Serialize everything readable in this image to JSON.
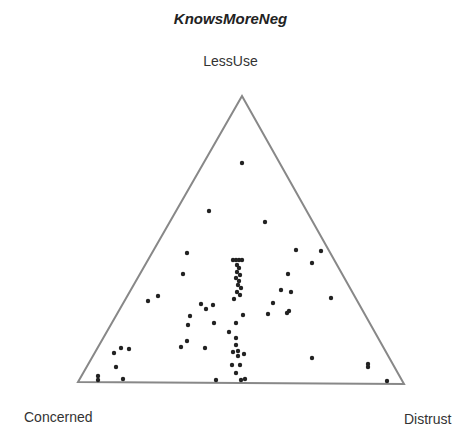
{
  "chart_data": {
    "type": "scatter",
    "subtype": "ternary",
    "title": "KnowsMoreNeg",
    "vertex_labels": {
      "top": "LessUse",
      "left": "Concerned",
      "right": "Distrust"
    },
    "triangle": {
      "top": [
        242,
        96
      ],
      "left": [
        78,
        382
      ],
      "right": [
        404,
        384
      ]
    },
    "grid": false,
    "legend": null,
    "point_color": "#222222",
    "line_color": "#888888",
    "points_px": [
      [
        242,
        163
      ],
      [
        209,
        211
      ],
      [
        265,
        222
      ],
      [
        187,
        253
      ],
      [
        183,
        274
      ],
      [
        288,
        274
      ],
      [
        233,
        260
      ],
      [
        236,
        260
      ],
      [
        239,
        260
      ],
      [
        242,
        260
      ],
      [
        237,
        265
      ],
      [
        239,
        268
      ],
      [
        237,
        272
      ],
      [
        240,
        275
      ],
      [
        236,
        278
      ],
      [
        239,
        281
      ],
      [
        238,
        285
      ],
      [
        241,
        288
      ],
      [
        237,
        292
      ],
      [
        240,
        295
      ],
      [
        234,
        299
      ],
      [
        296,
        250
      ],
      [
        321,
        251
      ],
      [
        312,
        263
      ],
      [
        281,
        290
      ],
      [
        291,
        292
      ],
      [
        331,
        298
      ],
      [
        273,
        303
      ],
      [
        289,
        311
      ],
      [
        287,
        313
      ],
      [
        148,
        301
      ],
      [
        158,
        296
      ],
      [
        201,
        304
      ],
      [
        206,
        309
      ],
      [
        213,
        305
      ],
      [
        190,
        316
      ],
      [
        188,
        325
      ],
      [
        214,
        323
      ],
      [
        229,
        332
      ],
      [
        187,
        341
      ],
      [
        181,
        347
      ],
      [
        205,
        348
      ],
      [
        114,
        353
      ],
      [
        121,
        348
      ],
      [
        129,
        349
      ],
      [
        116,
        367
      ],
      [
        98,
        376
      ],
      [
        98,
        380
      ],
      [
        123,
        379
      ],
      [
        243,
        315
      ],
      [
        236,
        323
      ],
      [
        236,
        338
      ],
      [
        236,
        345
      ],
      [
        238,
        351
      ],
      [
        233,
        352
      ],
      [
        238,
        356
      ],
      [
        244,
        354
      ],
      [
        232,
        365
      ],
      [
        240,
        365
      ],
      [
        236,
        373
      ],
      [
        216,
        380
      ],
      [
        241,
        380
      ],
      [
        245,
        379
      ],
      [
        268,
        314
      ],
      [
        312,
        358
      ],
      [
        368,
        364
      ],
      [
        368,
        367
      ],
      [
        387,
        381
      ]
    ]
  }
}
